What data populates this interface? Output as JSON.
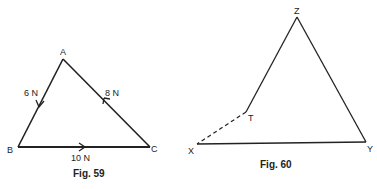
{
  "figures": [
    {
      "caption": "Fig. 59",
      "vertices": {
        "A": {
          "label": "A",
          "x": 63,
          "y": 59
        },
        "B": {
          "label": "B",
          "x": 18,
          "y": 147
        },
        "C": {
          "label": "C",
          "x": 150,
          "y": 147
        }
      },
      "forces": [
        {
          "from": "A",
          "to": "B",
          "label": "6 N"
        },
        {
          "from": "B",
          "to": "C",
          "label": "10 N"
        },
        {
          "from": "C",
          "to": "A",
          "label": "8 N"
        }
      ]
    },
    {
      "caption": "Fig. 60",
      "vertices": {
        "Z": {
          "label": "Z",
          "x": 297,
          "y": 17
        },
        "T": {
          "label": "T",
          "x": 246,
          "y": 112
        },
        "X": {
          "label": "X",
          "x": 197,
          "y": 144
        },
        "Y": {
          "label": "Y",
          "x": 366,
          "y": 142
        }
      },
      "edges": [
        {
          "from": "X",
          "to": "Y",
          "style": "solid"
        },
        {
          "from": "Y",
          "to": "Z",
          "style": "solid"
        },
        {
          "from": "Z",
          "to": "T",
          "style": "solid"
        },
        {
          "from": "T",
          "to": "X",
          "style": "dashed"
        }
      ]
    }
  ],
  "colors": {
    "line": "#222222",
    "background": "#ffffff"
  }
}
